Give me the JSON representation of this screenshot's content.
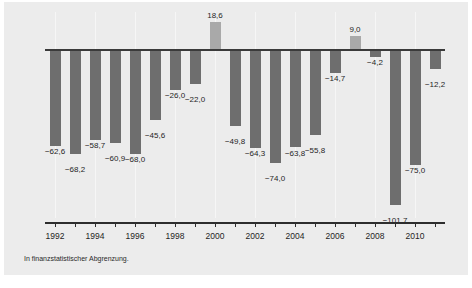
{
  "chart_data": {
    "type": "bar",
    "title": "",
    "subtitle": "",
    "xlabel": "",
    "ylabel": "",
    "categories": [
      1992,
      1993,
      1994,
      1995,
      1996,
      1997,
      1998,
      1999,
      2000,
      2001,
      2002,
      2003,
      2004,
      2005,
      2006,
      2007,
      2008,
      2009,
      2010,
      2011
    ],
    "values": [
      -62.6,
      -68.2,
      -58.7,
      -60.9,
      -68.0,
      -45.6,
      -26.0,
      -22.0,
      18.6,
      -49.8,
      -64.3,
      -74.0,
      -63.8,
      -55.8,
      -14.7,
      9.0,
      -4.2,
      -101.7,
      -75.0,
      -12.2
    ],
    "value_labels": [
      "−62,6",
      "−68,2",
      "−58,7",
      "−60,9",
      "−68,0",
      "−45,6",
      "−26,0",
      "−22,0",
      "18,6",
      "−49,8",
      "−64,3",
      "−74,0",
      "−63,8",
      "−55,8",
      "−14,7",
      "9,0",
      "−4,2",
      "−101,7",
      "−75,0",
      "−12,2"
    ],
    "tick_labels": [
      "1992",
      "1994",
      "1996",
      "1998",
      "2000",
      "2002",
      "2004",
      "2006",
      "2008",
      "2010"
    ],
    "tick_years": [
      1992,
      1994,
      1996,
      1998,
      2000,
      2002,
      2004,
      2006,
      2008,
      2010
    ],
    "ylim": [
      -110,
      25
    ],
    "grid": "vertical-light",
    "legend": "none",
    "bar_color_negative": "#6e6e6e",
    "bar_color_positive": "#a9a9a9",
    "background": "#ececec",
    "axis_color": "#2d2d2d"
  },
  "footnote": {
    "text": "In finanzstatistischer Abgrenzung."
  }
}
